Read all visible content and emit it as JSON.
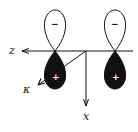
{
  "diagram": {
    "axes": {
      "z_label": "z",
      "x_label": "x",
      "y_label": "κ"
    },
    "orbitals": [
      {
        "upper_lobe_sign": "−",
        "lower_lobe_sign": "+",
        "upper_fill": "#ffffff",
        "lower_fill": "#111111"
      },
      {
        "upper_lobe_sign": "−",
        "lower_lobe_sign": "+",
        "upper_fill": "#ffffff",
        "lower_fill": "#111111"
      }
    ]
  }
}
